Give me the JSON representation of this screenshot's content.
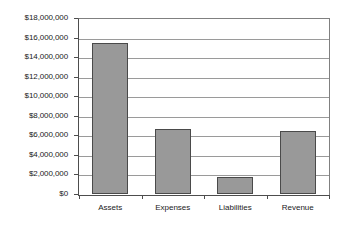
{
  "chart_data": {
    "type": "bar",
    "title": "",
    "subtitle": "",
    "xlabel": "",
    "ylabel": "",
    "categories": [
      "Assets",
      "Expenses",
      "Liabilities",
      "Revenue"
    ],
    "values": [
      15400000,
      6700000,
      1700000,
      6400000
    ],
    "series": [
      {
        "name": "",
        "values": [
          15400000,
          6700000,
          1700000,
          6400000
        ]
      }
    ],
    "ylim": [
      0,
      18000000
    ],
    "ytick_step": 2000000,
    "ytick_labels": [
      "$18,000,000",
      "$16,000,000",
      "$14,000,000",
      "$12,000,000",
      "$10,000,000",
      "$8,000,000",
      "$6,000,000",
      "$4,000,000",
      "$2,000,000",
      "$0"
    ],
    "ytick_values": [
      18000000,
      16000000,
      14000000,
      12000000,
      10000000,
      8000000,
      6000000,
      4000000,
      2000000,
      0
    ],
    "grid": true,
    "grid_axis": "y",
    "legend": false,
    "legend_position": "none",
    "annotations": [],
    "colors": {
      "bar_fill": "#999999",
      "bar_border": "#4a4a4a",
      "gridline": "#9a9a9a",
      "axis": "#4d4d4d",
      "plot_background": "#ffffff",
      "text": "#1a1a1a"
    }
  }
}
